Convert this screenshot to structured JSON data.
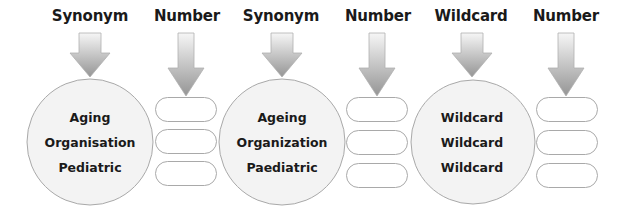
{
  "columns": [
    {
      "type": "circle",
      "label": "Synonym",
      "items": [
        "Aging",
        "Organisation",
        "Pediatric"
      ]
    },
    {
      "type": "slots",
      "label": "Number",
      "slots": [
        "",
        "",
        ""
      ]
    },
    {
      "type": "circle",
      "label": "Synonym",
      "items": [
        "Ageing",
        "Organization",
        "Paediatric"
      ]
    },
    {
      "type": "slots",
      "label": "Number",
      "slots": [
        "",
        "",
        ""
      ]
    },
    {
      "type": "circle",
      "label": "Wildcard",
      "items": [
        "Wildcard",
        "Wildcard",
        "Wildcard"
      ]
    },
    {
      "type": "slots",
      "label": "Number",
      "slots": [
        "",
        "",
        ""
      ]
    }
  ],
  "colors": {
    "arrow_top": "#f4f4f4",
    "arrow_bottom": "#9a9a9a",
    "circle_fill": "#f3f3f3",
    "outline": "#a9a9a9"
  }
}
